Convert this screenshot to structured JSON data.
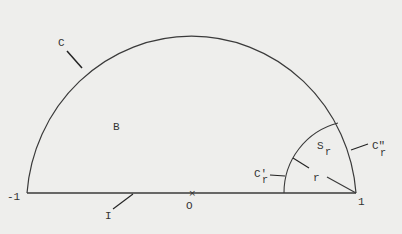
{
  "diagram": {
    "colors": {
      "background": "#eeeeec",
      "stroke": "#3a3a3a",
      "text": "#333333"
    },
    "axis_labels": {
      "left_end": "-1",
      "origin": "O",
      "right_end": "1"
    },
    "region_labels": {
      "outer_curve": "C",
      "region": "B",
      "segment": "I",
      "sector": "S",
      "sector_sub": "r",
      "radius": "r",
      "inner_arc": "C'",
      "inner_arc_sub": "r",
      "outer_arc_part": "C\"",
      "outer_arc_part_sub": "r"
    }
  }
}
